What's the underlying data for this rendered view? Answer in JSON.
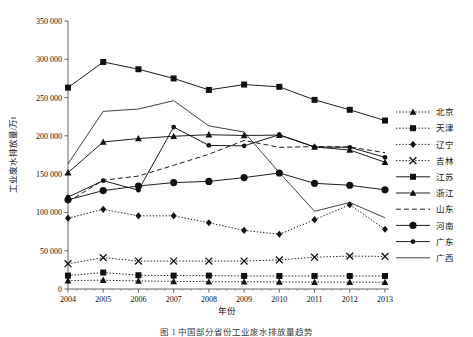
{
  "figure": {
    "caption": "图 1   中国部分省份工业废水排放量趋势",
    "background_color": "#ffffff",
    "line_color": "#111111"
  },
  "chart_data": {
    "type": "line",
    "title": "",
    "xlabel": "年份",
    "ylabel": "工业废水排放量/万t",
    "x": [
      "2004",
      "2005",
      "2006",
      "2007",
      "2008",
      "2009",
      "2010",
      "2011",
      "2012",
      "2013"
    ],
    "xlim": [
      "2004",
      "2013"
    ],
    "ylim": [
      0,
      350000
    ],
    "ytick_labels": [
      "0",
      "50 000",
      "100 000",
      "150 000",
      "200 000",
      "250 000",
      "300 000",
      "350 000"
    ],
    "ytick_values": [
      0,
      50000,
      100000,
      150000,
      200000,
      250000,
      300000,
      350000
    ],
    "grid": false,
    "legend_position": "right",
    "series": [
      {
        "name": "北京",
        "marker": "triangle",
        "linestyle": "dotted",
        "values": [
          11000,
          11500,
          10500,
          10000,
          9500,
          9500,
          9200,
          9000,
          9000,
          8800
        ]
      },
      {
        "name": "天津",
        "marker": "square",
        "linestyle": "dotted",
        "values": [
          17500,
          21500,
          18000,
          17500,
          17500,
          17000,
          17000,
          17000,
          17000,
          17000
        ]
      },
      {
        "name": "辽宁",
        "marker": "diamond",
        "linestyle": "dotted",
        "values": [
          92500,
          104000,
          95500,
          95500,
          86500,
          76500,
          71500,
          90500,
          110000,
          78000
        ]
      },
      {
        "name": "吉林",
        "marker": "cross",
        "linestyle": "dotted",
        "values": [
          33000,
          41000,
          36500,
          36500,
          36500,
          36500,
          38000,
          41500,
          43000,
          42500
        ]
      },
      {
        "name": "江苏",
        "marker": "square",
        "linestyle": "solid",
        "values": [
          263000,
          296500,
          287000,
          275000,
          260000,
          267000,
          264000,
          247000,
          234000,
          220000
        ]
      },
      {
        "name": "浙江",
        "marker": "triangle",
        "linestyle": "solid",
        "values": [
          152000,
          192000,
          196500,
          199500,
          201500,
          200500,
          201000,
          185500,
          181500,
          165500
        ]
      },
      {
        "name": "山东",
        "marker": "none",
        "linestyle": "dashed",
        "values": [
          114000,
          142000,
          147500,
          161500,
          176000,
          194000,
          185000,
          186000,
          185500,
          178000
        ]
      },
      {
        "name": "河南",
        "marker": "circle-large",
        "linestyle": "solid",
        "values": [
          116500,
          128500,
          134500,
          139000,
          140500,
          145500,
          151500,
          138000,
          135500,
          129500
        ]
      },
      {
        "name": "广东",
        "marker": "circle-small",
        "linestyle": "solid",
        "values": [
          120000,
          141500,
          129000,
          211500,
          187500,
          187000,
          201500,
          185500,
          185000,
          172000
        ]
      },
      {
        "name": "广西",
        "marker": "none",
        "linestyle": "solid",
        "values": [
          163500,
          232000,
          235000,
          246000,
          213000,
          205000,
          152000,
          101500,
          113000,
          93000
        ]
      }
    ]
  },
  "legend": {
    "items": [
      {
        "label": "北京",
        "marker": "triangle",
        "linestyle": "dotted"
      },
      {
        "label": "天津",
        "marker": "square",
        "linestyle": "dotted"
      },
      {
        "label": "辽宁",
        "marker": "diamond",
        "linestyle": "dotted"
      },
      {
        "label": "吉林",
        "marker": "cross",
        "linestyle": "dotted"
      },
      {
        "label": "江苏",
        "marker": "square",
        "linestyle": "solid"
      },
      {
        "label": "浙江",
        "marker": "triangle",
        "linestyle": "solid"
      },
      {
        "label": "山东",
        "marker": "none",
        "linestyle": "dashed"
      },
      {
        "label": "河南",
        "marker": "circle-large",
        "linestyle": "solid"
      },
      {
        "label": "广东",
        "marker": "circle-small",
        "linestyle": "solid"
      },
      {
        "label": "广西",
        "marker": "none",
        "linestyle": "solid"
      }
    ]
  }
}
